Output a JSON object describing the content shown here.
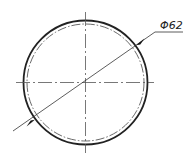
{
  "drawing": {
    "title": "Circle with diameter dimension",
    "dimension_label": "Φ62",
    "center": [
      85.5,
      82.5
    ],
    "outer_radius": 62,
    "inner_radius": 58,
    "colors": {
      "line": "#222222",
      "centerline": "#555555",
      "background": "#ffffff"
    }
  }
}
